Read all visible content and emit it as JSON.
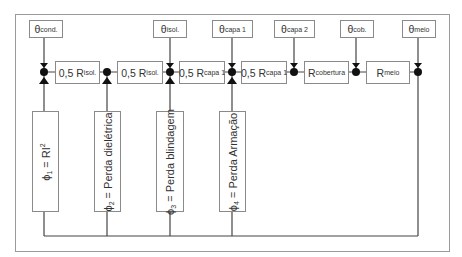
{
  "diagram": {
    "type": "thermal-circuit",
    "temperature_nodes": [
      {
        "symbol": "θ",
        "sub": "cond."
      },
      {
        "symbol": "θ",
        "sub": "isol."
      },
      {
        "symbol": "θ",
        "sub": "capa 1"
      },
      {
        "symbol": "θ",
        "sub": "capa 2"
      },
      {
        "symbol": "θ",
        "sub": "cob."
      },
      {
        "symbol": "θ",
        "sub": "meio"
      }
    ],
    "resistors": [
      {
        "prefix": "0,5 R",
        "sub": "isol."
      },
      {
        "prefix": "0,5 R",
        "sub": "isol."
      },
      {
        "prefix": "0,5 R",
        "sub": "capa 1"
      },
      {
        "prefix": "0,5 R",
        "sub": "capa 1"
      },
      {
        "prefix": "R",
        "sub": "cobertura"
      },
      {
        "prefix": "R",
        "sub": "meio"
      }
    ],
    "heat_sources": [
      {
        "symbol": "ϕ",
        "sub": "1",
        "rest": " = RI",
        "sup": "2"
      },
      {
        "symbol": "ϕ",
        "sub": "2",
        "rest": " = Perda dielétrica",
        "sup": ""
      },
      {
        "symbol": "ϕ",
        "sub": "3",
        "rest": " = Perda blindagem",
        "sup": ""
      },
      {
        "symbol": "ϕ",
        "sub": "4",
        "rest": " = Perda  Armação",
        "sup": ""
      }
    ]
  }
}
